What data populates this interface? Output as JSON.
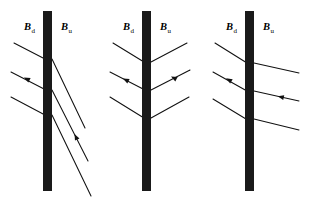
{
  "figure": {
    "type": "diagram",
    "background_color": "#ffffff",
    "line_color": "#111111",
    "slab_color": "#1a1a1a",
    "width": 311,
    "height": 201
  },
  "labels": {
    "downstream_symbol": "B",
    "downstream_subscript": "d",
    "upstream_symbol": "B",
    "upstream_subscript": "u"
  },
  "panels": [
    {
      "id": "panel-1",
      "name": "oblique-shock-steep-downstream",
      "slab": {
        "x": 43,
        "y": 11,
        "width": 9,
        "height": 180
      },
      "label_downstream_x": 24,
      "label_upstream_x": 61,
      "label_y": 30,
      "left_lines": [
        {
          "x1": 14,
          "y1": 43,
          "x2": 45,
          "y2": 59
        },
        {
          "x1": 11,
          "y1": 72,
          "x2": 46,
          "y2": 90
        },
        {
          "x1": 11,
          "y1": 97,
          "x2": 45,
          "y2": 115
        }
      ],
      "right_lines": [
        {
          "x1": 52,
          "y1": 59,
          "x2": 85,
          "y2": 128
        },
        {
          "x1": 52,
          "y1": 90,
          "x2": 88,
          "y2": 161
        },
        {
          "x1": 52,
          "y1": 115,
          "x2": 91,
          "y2": 196
        }
      ],
      "arrows": [
        {
          "x": 27,
          "y": 79,
          "angle": 207,
          "target": "left-middle"
        },
        {
          "x": 76,
          "y": 137,
          "angle": 244,
          "target": "right-middle"
        }
      ]
    },
    {
      "id": "panel-2",
      "name": "symmetric-chevron-shock",
      "slab": {
        "x": 142,
        "y": 11,
        "width": 9,
        "height": 180
      },
      "label_downstream_x": 123,
      "label_upstream_x": 160,
      "label_y": 30,
      "left_lines": [
        {
          "x1": 113,
          "y1": 43,
          "x2": 144,
          "y2": 62
        },
        {
          "x1": 110,
          "y1": 72,
          "x2": 145,
          "y2": 90
        },
        {
          "x1": 110,
          "y1": 97,
          "x2": 144,
          "y2": 118
        }
      ],
      "right_lines": [
        {
          "x1": 151,
          "y1": 62,
          "x2": 187,
          "y2": 43
        },
        {
          "x1": 151,
          "y1": 90,
          "x2": 190,
          "y2": 70
        },
        {
          "x1": 151,
          "y1": 118,
          "x2": 189,
          "y2": 97
        }
      ],
      "arrows": [
        {
          "x": 126,
          "y": 80,
          "angle": 208,
          "target": "left-middle"
        },
        {
          "x": 174,
          "y": 78,
          "angle": 208,
          "target": "right-middle"
        }
      ]
    },
    {
      "id": "panel-3",
      "name": "perpendicular-upstream-shock",
      "slab": {
        "x": 245,
        "y": 11,
        "width": 9,
        "height": 180
      },
      "label_downstream_x": 226,
      "label_upstream_x": 263,
      "label_y": 30,
      "left_lines": [
        {
          "x1": 215,
          "y1": 43,
          "x2": 247,
          "y2": 63
        },
        {
          "x1": 213,
          "y1": 72,
          "x2": 247,
          "y2": 91
        },
        {
          "x1": 213,
          "y1": 99,
          "x2": 246,
          "y2": 119
        }
      ],
      "right_lines": [
        {
          "x1": 254,
          "y1": 63,
          "x2": 299,
          "y2": 73
        },
        {
          "x1": 254,
          "y1": 91,
          "x2": 299,
          "y2": 101
        },
        {
          "x1": 254,
          "y1": 119,
          "x2": 299,
          "y2": 130
        }
      ],
      "arrows": [
        {
          "x": 229,
          "y": 80,
          "angle": 210,
          "target": "left-middle"
        },
        {
          "x": 281,
          "y": 97,
          "angle": 192,
          "target": "right-middle"
        }
      ]
    }
  ]
}
